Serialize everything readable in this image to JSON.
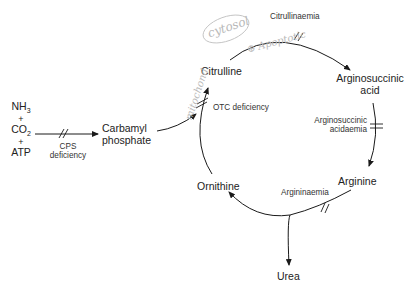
{
  "diagram": {
    "top_cut_text": "",
    "inputs": {
      "nh3": "NH",
      "nh3_sub": "3",
      "plus1": "+",
      "co2": "CO",
      "co2_sub": "2",
      "plus2": "+",
      "atp": "ATP"
    },
    "nodes": {
      "carbamyl_phosphate": [
        "Carbamyl",
        "phosphate"
      ],
      "citrulline": "Citrulline",
      "argininosuccinic_acid": [
        "Arginosuccinic",
        "acid"
      ],
      "arginine": "Arginine",
      "ornithine": "Ornithine",
      "urea": "Urea"
    },
    "deficiencies": {
      "cps": [
        "CPS",
        "deficiency"
      ],
      "otc": "OTC deficiency",
      "citrullinaemia": "Citrullinaemia",
      "argininosuccinic_acidaemia": [
        "Arginosuccinic",
        "acidaemia"
      ],
      "argininaemia": "Argininaemia"
    },
    "handwritten": {
      "cytosol": "cytosol",
      "apoptotic": "⊕ Apoptotic",
      "mitochondrial": "mitochond."
    },
    "colors": {
      "line": "#1a1a1a",
      "text": "#222222",
      "handwriting": "#b9b9b9"
    }
  }
}
